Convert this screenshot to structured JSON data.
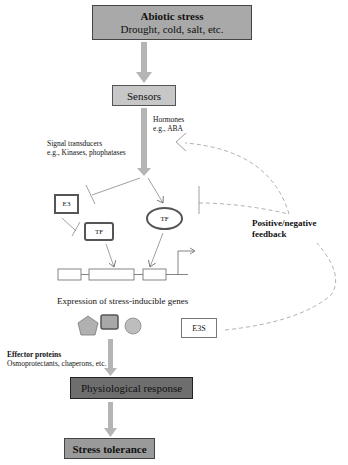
{
  "nodes": {
    "abiotic_stress": {
      "title": "Abiotic stress",
      "subtitle": "Drought, cold, salt, etc."
    },
    "sensors": {
      "label": "Sensors"
    },
    "hormones": {
      "line1": "Hormones",
      "line2": "e.g., ABA"
    },
    "signal_transducers": {
      "line1": "Signal transducers",
      "line2": "e.g., Kinases, phophatases"
    },
    "e3": {
      "label": "E3"
    },
    "tf_box": {
      "label": "TF"
    },
    "tf_ellipse": {
      "label": "TF"
    },
    "feedback": {
      "line1": "Positive/negative",
      "line2": "feedback"
    },
    "expression": {
      "label": "Expression of stress-inducible genes"
    },
    "e3s": {
      "label": "E3S"
    },
    "effector": {
      "title": "Effector proteins",
      "subtitle": "Osmoprotectants, chaperons, etc."
    },
    "physiological_response": {
      "label": "Physiological response"
    },
    "stress_tolerance": {
      "label": "Stress tolerance"
    }
  },
  "colors": {
    "arrow_gray": "#b5b5b5",
    "abiotic_fill": "#a9a9a9",
    "sensors_fill": "#c7c7c7",
    "physio_fill": "#6e6e6e",
    "tolerance_fill": "#9a9a9a",
    "effector_shape_fill": "#b0b0b0",
    "dashed_line": "#9a9a9a"
  }
}
